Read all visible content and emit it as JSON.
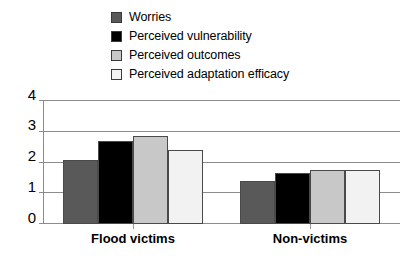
{
  "chart_data": {
    "type": "bar",
    "title": "",
    "subtitle": "",
    "xlabel": "",
    "ylabel": "",
    "categories": [
      "Flood victims",
      "Non-victims"
    ],
    "series": [
      {
        "name": "Worries",
        "values": [
          2.08,
          1.4
        ],
        "color": "#595959"
      },
      {
        "name": "Perceived vulnerability",
        "values": [
          2.7,
          1.66
        ],
        "color": "#000000"
      },
      {
        "name": "Perceived outcomes",
        "values": [
          2.86,
          1.76
        ],
        "color": "#c8c8c8"
      },
      {
        "name": "Perceived adaptation efficacy",
        "values": [
          2.41,
          1.75
        ],
        "color": "#f2f2f2"
      }
    ],
    "ylim": [
      0,
      4
    ],
    "yticks": [
      "0",
      "1",
      "2",
      "3",
      "4"
    ],
    "grid": true,
    "legend_position": "top-center",
    "annotations": []
  },
  "legend": {
    "items": [
      {
        "label": "Worries",
        "color": "#595959"
      },
      {
        "label": "Perceived vulnerability",
        "color": "#000000"
      },
      {
        "label": "Perceived outcomes",
        "color": "#c8c8c8"
      },
      {
        "label": "Perceived adaptation efficacy",
        "color": "#f2f2f2"
      }
    ]
  },
  "axes": {
    "y_ticks": [
      "4",
      "3",
      "2",
      "1",
      "0"
    ],
    "x_labels": [
      "Flood victims",
      "Non-victims"
    ]
  }
}
